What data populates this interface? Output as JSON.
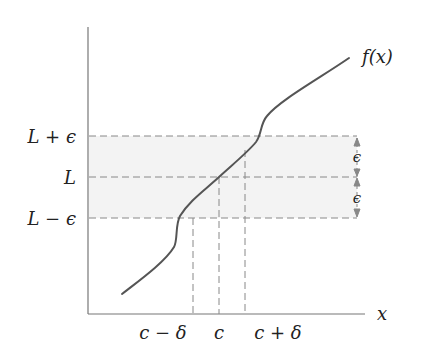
{
  "diagram": {
    "function_label": "f(x)",
    "x_axis_label": "x",
    "y_labels": {
      "upper": "L + ϵ",
      "middle": "L",
      "lower": "L − ϵ"
    },
    "x_labels": {
      "left": "c − δ",
      "center": "c",
      "right": "c + δ"
    },
    "epsilon_marks": [
      "ϵ",
      "ϵ"
    ],
    "colors": {
      "curve": "#555555",
      "axis": "#777777",
      "dashed": "#888888",
      "band": "#f4f4f4",
      "text": "#222222"
    }
  }
}
